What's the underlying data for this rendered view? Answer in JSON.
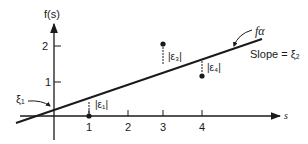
{
  "diagram": {
    "y_axis_label": "f(s)",
    "x_axis_label": "s",
    "y_ticks": [
      {
        "value": 1,
        "label": "1"
      },
      {
        "value": 2,
        "label": "2"
      }
    ],
    "x_ticks": [
      {
        "value": 1,
        "label": "1"
      },
      {
        "value": 2,
        "label": "2"
      },
      {
        "value": 3,
        "label": "3"
      },
      {
        "value": 4,
        "label": "4"
      }
    ],
    "line_label": "fα",
    "slope_label": "Slope = ξ₂",
    "intercept_label": "ξ₁",
    "errors": [
      {
        "label": "|ε₁|",
        "s": 1,
        "value": 0
      },
      {
        "label": "|ε₃|",
        "s": 3,
        "value": 2
      },
      {
        "label": "|ε₄|",
        "s": 4,
        "value": 1
      }
    ],
    "colors": {
      "ink": "#1a1a1a",
      "background": "#ffffff"
    }
  }
}
